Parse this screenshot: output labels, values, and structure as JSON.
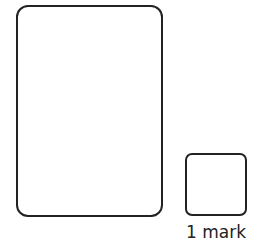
{
  "diagram": {
    "shapes": [
      {
        "name": "answer-box",
        "type": "rounded-rectangle"
      },
      {
        "name": "mark-box",
        "type": "rounded-rectangle"
      }
    ],
    "mark_label": "1 mark"
  },
  "colors": {
    "stroke": "#222222",
    "background": "#ffffff"
  }
}
